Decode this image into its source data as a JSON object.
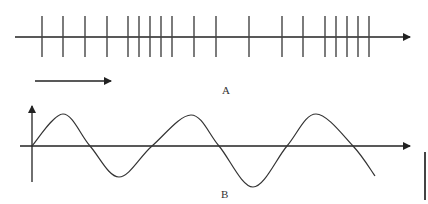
{
  "diagram": {
    "stroke_color": "#222222",
    "tick_color": "#444444",
    "part_a": {
      "label": "A",
      "axis": {
        "x1": 15,
        "x2": 410,
        "y": 37
      },
      "tick_top": 16,
      "tick_bottom": 57,
      "ticks_x": [
        42,
        63,
        85,
        107,
        128,
        139,
        150,
        161,
        172,
        194,
        216,
        249,
        282,
        303,
        325,
        336,
        347,
        358,
        369
      ],
      "direction_arrow": {
        "x1": 35,
        "x2": 111,
        "y": 81
      }
    },
    "part_b": {
      "label": "B",
      "x_axis": {
        "x1": 20,
        "x2": 410,
        "y": 146
      },
      "y_axis": {
        "x": 32,
        "y_top": 106,
        "y_bottom": 182
      },
      "wave_points": [
        [
          32,
          146
        ],
        [
          63,
          114
        ],
        [
          90,
          146
        ],
        [
          119,
          177
        ],
        [
          152,
          146
        ],
        [
          191,
          115
        ],
        [
          219,
          146
        ],
        [
          253,
          187
        ],
        [
          287,
          146
        ],
        [
          316,
          114
        ],
        [
          353,
          146
        ],
        [
          375,
          176
        ]
      ],
      "scale_bar": {
        "x": 425,
        "y1": 152,
        "y2": 200
      }
    }
  }
}
